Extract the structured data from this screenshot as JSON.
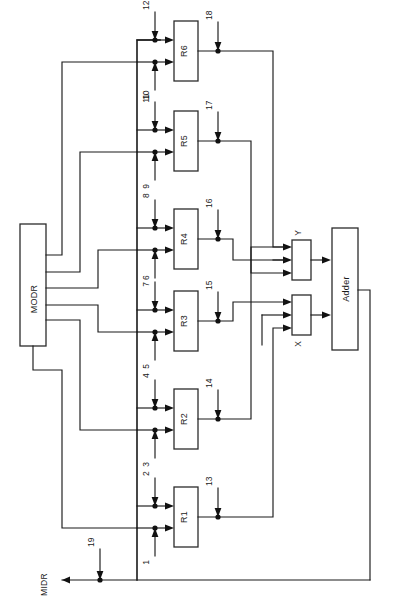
{
  "diagram": {
    "orientation": "rotated-90",
    "background_color": "#ffffff",
    "line_color": "#1a1a1a"
  },
  "blocks": {
    "modr": {
      "label": "MODR",
      "x": 20,
      "y": 224,
      "w": 26,
      "h": 122
    },
    "midr": {
      "label": "MIDR"
    },
    "adder": {
      "label": "Adder",
      "x": 332,
      "y": 228,
      "w": 26,
      "h": 122
    },
    "mux_y": {
      "label": "Y",
      "x": 292,
      "y": 240,
      "w": 19,
      "h": 40
    },
    "mux_x": {
      "label": "X",
      "x": 292,
      "y": 295,
      "w": 19,
      "h": 40
    }
  },
  "registers": [
    {
      "id": "r1",
      "label": "R1",
      "x": 174,
      "y": 487,
      "w": 24,
      "h": 60,
      "in_top_signal": "2",
      "in_bottom_signal": "1",
      "out_signal": "13"
    },
    {
      "id": "r2",
      "label": "R2",
      "x": 174,
      "y": 389,
      "w": 24,
      "h": 60,
      "in_top_signal": "4",
      "in_bottom_signal": "3",
      "out_signal": "14"
    },
    {
      "id": "r3",
      "label": "R3",
      "x": 174,
      "y": 291,
      "w": 24,
      "h": 60,
      "in_top_signal": "6",
      "in_bottom_signal": "5",
      "out_signal": "15"
    },
    {
      "id": "r4",
      "label": "R4",
      "x": 174,
      "y": 209,
      "w": 24,
      "h": 60,
      "in_top_signal": "8",
      "in_bottom_signal": "7",
      "out_signal": "16"
    },
    {
      "id": "r5",
      "label": "R5",
      "x": 174,
      "y": 111,
      "w": 24,
      "h": 60,
      "in_top_signal": "10",
      "in_bottom_signal": "9",
      "out_signal": "17"
    },
    {
      "id": "r6",
      "label": "R6",
      "x": 174,
      "y": 21,
      "w": 24,
      "h": 60,
      "in_top_signal": "12",
      "in_bottom_signal": "11",
      "out_signal": "18"
    }
  ],
  "control_signals": [
    {
      "name": "1",
      "direction": "up",
      "source": "MODR"
    },
    {
      "name": "2",
      "direction": "down",
      "source": "bus"
    },
    {
      "name": "3",
      "direction": "up",
      "source": "MODR"
    },
    {
      "name": "4",
      "direction": "down",
      "source": "bus"
    },
    {
      "name": "5",
      "direction": "up",
      "source": "MODR"
    },
    {
      "name": "6",
      "direction": "down",
      "source": "bus"
    },
    {
      "name": "7",
      "direction": "up",
      "source": "MODR"
    },
    {
      "name": "8",
      "direction": "down",
      "source": "bus"
    },
    {
      "name": "9",
      "direction": "up",
      "source": "MODR"
    },
    {
      "name": "10",
      "direction": "down",
      "source": "bus"
    },
    {
      "name": "11",
      "direction": "up",
      "source": "MODR"
    },
    {
      "name": "12",
      "direction": "down",
      "source": "bus"
    },
    {
      "name": "13",
      "direction": "down",
      "source": "R1-output"
    },
    {
      "name": "14",
      "direction": "down",
      "source": "R2-output"
    },
    {
      "name": "15",
      "direction": "down",
      "source": "R3-output"
    },
    {
      "name": "16",
      "direction": "down",
      "source": "R4-output"
    },
    {
      "name": "17",
      "direction": "down",
      "source": "R5-output"
    },
    {
      "name": "18",
      "direction": "down",
      "source": "R6-output"
    },
    {
      "name": "19",
      "direction": "down",
      "source": "MIDR-bus"
    }
  ],
  "labels": {
    "midr_bus": "MIDR",
    "modr_block": "MODR",
    "adder_block": "Adder",
    "mux_y": "Y",
    "mux_x": "X",
    "r1": "R1",
    "r2": "R2",
    "r3": "R3",
    "r4": "R4",
    "r5": "R5",
    "r6": "R6",
    "s1": "1",
    "s2": "2",
    "s3": "3",
    "s4": "4",
    "s5": "5",
    "s6": "6",
    "s7": "7",
    "s8": "8",
    "s9": "9",
    "s10": "10",
    "s11": "11",
    "s12": "12",
    "s13": "13",
    "s14": "14",
    "s15": "15",
    "s16": "16",
    "s17": "17",
    "s18": "18",
    "s19": "19"
  }
}
